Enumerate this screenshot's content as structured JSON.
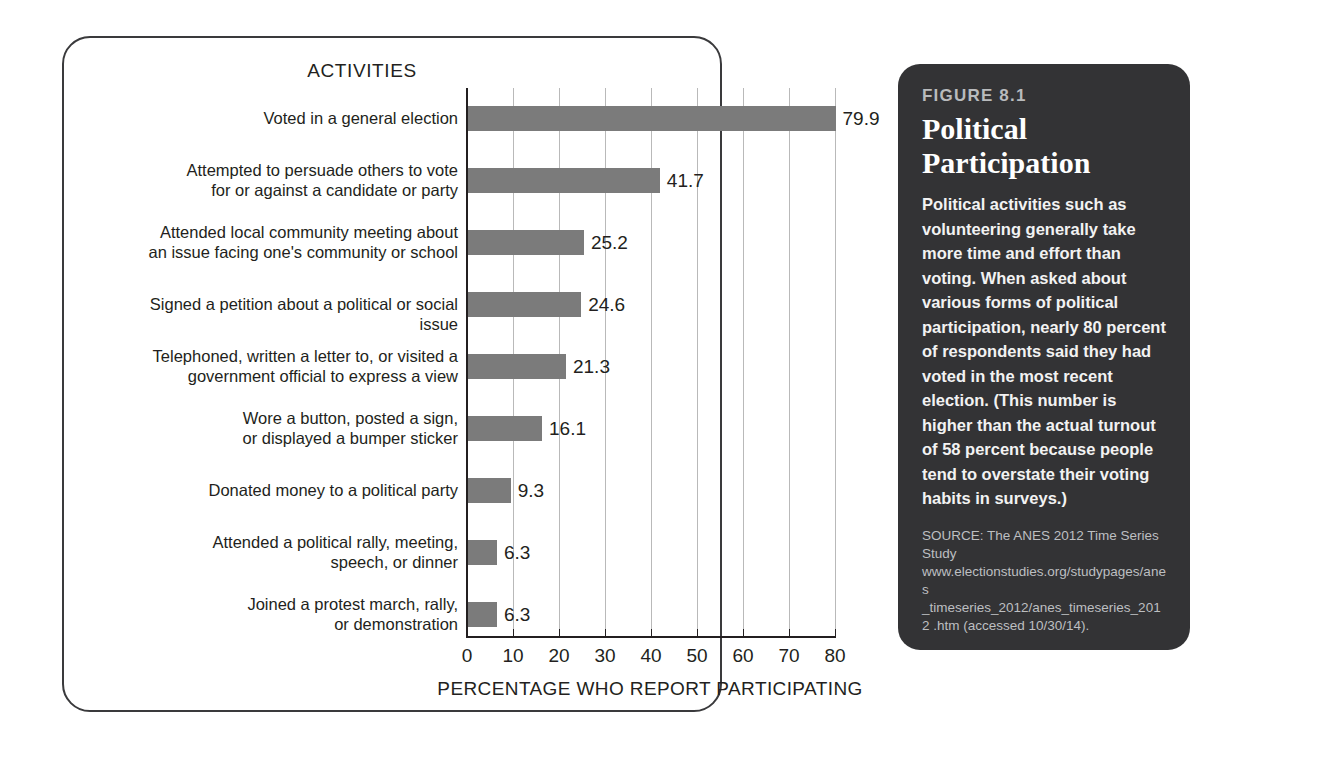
{
  "chart_data": {
    "type": "bar",
    "orientation": "horizontal",
    "title": "ACTIVITIES",
    "xlabel": "PERCENTAGE WHO REPORT PARTICIPATING",
    "ylabel": "",
    "xlim": [
      0,
      80
    ],
    "xticks": [
      0,
      10,
      20,
      30,
      40,
      50,
      60,
      70,
      80
    ],
    "grid": true,
    "legend": "none",
    "bar_color": "#7b7b7b",
    "categories": [
      "Voted in a general election",
      "Attempted to persuade others to vote for or against a candidate or party",
      "Attended local community meeting about an issue facing one's community or school",
      "Signed a petition about a political or social issue",
      "Telephoned, written a letter to, or visited a government official to express a view",
      "Wore a button, posted a sign, or displayed a bumper sticker",
      "Donated money to a political party",
      "Attended a political rally, meeting, speech, or dinner",
      "Joined a protest march, rally, or demonstration"
    ],
    "category_lines": [
      [
        "Voted in a general election"
      ],
      [
        "Attempted to persuade others to vote",
        "for or against a candidate or party"
      ],
      [
        "Attended local community meeting about",
        "an issue facing one's community or school"
      ],
      [
        "Signed a petition about a political or social issue"
      ],
      [
        "Telephoned, written a letter to, or visited a",
        "government official to express a view"
      ],
      [
        "Wore a button, posted a sign,",
        "or displayed a bumper sticker"
      ],
      [
        "Donated money to a political party"
      ],
      [
        "Attended a political rally, meeting,",
        "speech, or dinner"
      ],
      [
        "Joined a protest march, rally,",
        "or demonstration"
      ]
    ],
    "values": [
      79.9,
      41.7,
      25.2,
      24.6,
      21.3,
      16.1,
      9.3,
      6.3,
      6.3
    ],
    "value_labels": [
      "79.9",
      "41.7",
      "25.2",
      "24.6",
      "21.3",
      "16.1",
      "9.3",
      "6.3",
      "6.3"
    ]
  },
  "caption": {
    "figure_number": "FIGURE 8.1",
    "title_line_1": "Political",
    "title_line_2": "Participation",
    "body": "Political activities such as volunteering generally take more time and effort than voting. When asked about various forms of political participation, nearly 80 percent of respondents said they had voted in the most recent election. (This number is higher than the actual turnout of 58 percent because people tend to overstate their voting habits in surveys.)",
    "source": "SOURCE: The ANES 2012 Time Series Study www.electionstudies.org/studypages/anes _timeseries_2012/anes_timeseries_2012 .htm (accessed 10/30/14).",
    "panel_color": "#333335",
    "figure_number_color": "#b9bbbd"
  }
}
